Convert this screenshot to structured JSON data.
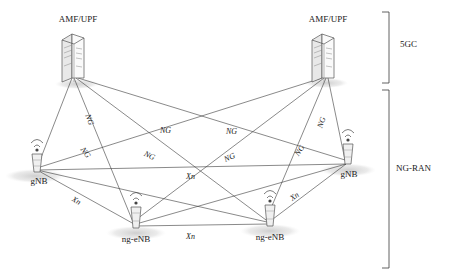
{
  "diagram": {
    "nodes": [
      {
        "id": "amf-upf-left",
        "label": "AMF/UPF",
        "type": "core-server",
        "x": 70,
        "y": 22
      },
      {
        "id": "amf-upf-right",
        "label": "AMF/UPF",
        "type": "core-server",
        "x": 321,
        "y": 22
      },
      {
        "id": "gnb-left",
        "label": "gNB",
        "type": "base-station",
        "x": 43,
        "y": 150
      },
      {
        "id": "gnb-right",
        "label": "gNB",
        "type": "base-station",
        "x": 349,
        "y": 140
      },
      {
        "id": "ng-enb-left",
        "label": "ng-eNB",
        "type": "base-station",
        "x": 131,
        "y": 210
      },
      {
        "id": "ng-enb-right",
        "label": "ng-eNB",
        "type": "base-station",
        "x": 262,
        "y": 208
      }
    ],
    "edge_labels": [
      {
        "id": "ng-1",
        "text": "NG",
        "x": 163,
        "y": 130
      },
      {
        "id": "ng-2",
        "text": "NG",
        "x": 229,
        "y": 131
      },
      {
        "id": "ng-3",
        "text": "NG",
        "x": 88,
        "y": 119
      },
      {
        "id": "ng-4",
        "text": "NG",
        "x": 320,
        "y": 122
      },
      {
        "id": "ng-5",
        "text": "NG",
        "x": 84,
        "y": 152
      },
      {
        "id": "ng-6",
        "text": "NG",
        "x": 148,
        "y": 155
      },
      {
        "id": "ng-7",
        "text": "NG",
        "x": 228,
        "y": 157
      },
      {
        "id": "ng-8",
        "text": "NG",
        "x": 298,
        "y": 150
      },
      {
        "id": "xn-1",
        "text": "Xn",
        "x": 190,
        "y": 176
      },
      {
        "id": "xn-2",
        "text": "Xn",
        "x": 76,
        "y": 200
      },
      {
        "id": "xn-3",
        "text": "Xn",
        "x": 294,
        "y": 196
      },
      {
        "id": "xn-4",
        "text": "Xn",
        "x": 190,
        "y": 236
      }
    ],
    "groups": [
      {
        "id": "group-5gc",
        "label": "5GC",
        "label_x": 409,
        "label_y": 44
      },
      {
        "id": "group-ng-ran",
        "label": "NG-RAN",
        "label_x": 399,
        "label_y": 168
      }
    ],
    "colors": {
      "line": "#3a3a3a",
      "text": "#1a1a1a",
      "shadow": "#d9d9d9",
      "device_fill": "#f2f2f2",
      "device_stroke": "#555555"
    }
  }
}
